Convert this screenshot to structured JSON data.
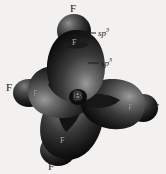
{
  "figure": {
    "background_color": "#f2f1ef",
    "lobe_color_dark": "#141414",
    "lobe_color_mid": "#3a3a3a",
    "lobe_color_light": "#8f8f8f",
    "center_atom": "B",
    "orbital_label": "sp",
    "orbital_superscript": "3",
    "atoms": {
      "top_f": "F",
      "left_f": "F",
      "right_f": "F",
      "bottom_f": "F",
      "inner_top_f": "F",
      "inner_left_f": "F",
      "inner_right_f": "F",
      "inner_bottom_f": "F"
    },
    "callouts": [
      {
        "label": "sp",
        "superscript": "3",
        "target": "fluorine-orbital"
      },
      {
        "label": "sp",
        "superscript": "3",
        "target": "boron-hybrid-orbital"
      }
    ]
  }
}
